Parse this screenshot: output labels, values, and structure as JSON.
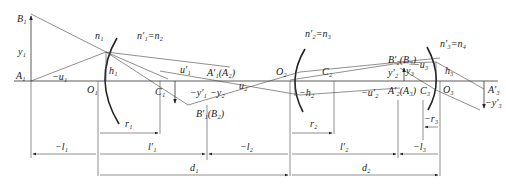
{
  "diagram": {
    "type": "multi-surface refraction system (three refracting surfaces)",
    "axis_labels": {
      "A1": "A₁",
      "B1": "B₁",
      "y1": "y₁",
      "u1": "−u₁",
      "O1": "O₁",
      "C1": "C₁",
      "h1": "h₁",
      "n1": "n₁",
      "n1p_eq_n2": "n′₁=n₂",
      "u1p": "u′₁",
      "A1p_A2": "A′₁(A₂)",
      "B1p_B2": "B′₁(B₂)",
      "y1p": "−y′₁",
      "y2": "−y₂",
      "u2": "u₂",
      "O2": "O₂",
      "C2": "C₂",
      "h2": "−h₂",
      "n2p_eq_n3": "n′₂=n₃",
      "u2p": "−u′₂",
      "B2p_B3": "B′₂(B₃)",
      "A2p_A3": "A′₂(A₃)",
      "y2p": "y′₂",
      "y3": "y₃",
      "u3": "−u₃",
      "h3": "h₃",
      "C3": "C₃",
      "O3": "O₃",
      "n3p_eq_n4": "n′₃=n₄",
      "A3p": "A′₃",
      "y3p": "−y′₃"
    },
    "dimensions": {
      "l1": "−l₁",
      "r1": "r₁",
      "l1p": "l′₁",
      "l2": "−l₂",
      "r2": "r₂",
      "l2p": "l′₂",
      "l3": "−l₃",
      "r3": "−r₃",
      "d1": "d₁",
      "d2": "d₂"
    }
  }
}
